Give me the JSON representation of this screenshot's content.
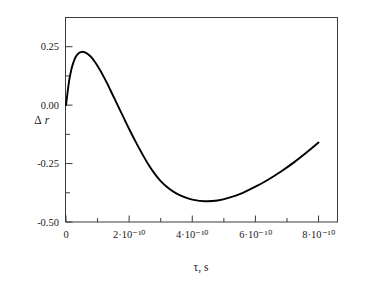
{
  "chart_data": {
    "type": "line",
    "title": "",
    "xlabel": "τ, s",
    "ylabel": "Δr",
    "xlim": [
      0,
      8.6e-10
    ],
    "ylim": [
      -0.5,
      0.375
    ],
    "grid": false,
    "legend": null,
    "x_ticks": [
      {
        "value": 0,
        "label": "0",
        "major": true
      },
      {
        "value": 1e-10,
        "label": "",
        "major": false
      },
      {
        "value": 2e-10,
        "label": "2·10⁻¹⁰",
        "major": true
      },
      {
        "value": 3e-10,
        "label": "",
        "major": false
      },
      {
        "value": 4e-10,
        "label": "4·10⁻¹⁰",
        "major": true
      },
      {
        "value": 5e-10,
        "label": "",
        "major": false
      },
      {
        "value": 6e-10,
        "label": "6·10⁻¹⁰",
        "major": true
      },
      {
        "value": 7e-10,
        "label": "",
        "major": false
      },
      {
        "value": 8e-10,
        "label": "8·10⁻¹⁰",
        "major": true
      }
    ],
    "y_ticks": [
      {
        "value": -0.5,
        "label": "-0.50",
        "major": true
      },
      {
        "value": -0.375,
        "label": "",
        "major": false
      },
      {
        "value": -0.25,
        "label": "-0.25",
        "major": true
      },
      {
        "value": -0.125,
        "label": "",
        "major": false
      },
      {
        "value": 0.0,
        "label": "0.00",
        "major": true
      },
      {
        "value": 0.125,
        "label": "",
        "major": false
      },
      {
        "value": 0.25,
        "label": "0.25",
        "major": true
      },
      {
        "value": 0.375,
        "label": "",
        "major": false
      }
    ],
    "series": [
      {
        "name": "Δr(τ)",
        "color": "#000000",
        "x": [
          0.0,
          5e-12,
          1e-11,
          1.5e-11,
          2e-11,
          3e-11,
          4e-11,
          5e-11,
          6e-11,
          7e-11,
          8e-11,
          9e-11,
          1e-10,
          1.1e-10,
          1.2e-10,
          1.3e-10,
          1.4e-10,
          1.5e-10,
          1.6e-10,
          1.8e-10,
          2e-10,
          2.2e-10,
          2.4e-10,
          2.6e-10,
          2.8e-10,
          3e-10,
          3.2e-10,
          3.4e-10,
          3.6e-10,
          3.8e-10,
          4e-10,
          4.4e-10,
          4.8e-10,
          5.2e-10,
          5.6e-10,
          6e-10,
          6.4e-10,
          6.8e-10,
          7.2e-10,
          7.6e-10,
          8e-10
        ],
        "y": [
          0.0,
          0.055,
          0.105,
          0.14,
          0.168,
          0.205,
          0.222,
          0.228,
          0.226,
          0.218,
          0.205,
          0.188,
          0.168,
          0.145,
          0.12,
          0.094,
          0.066,
          0.038,
          0.01,
          -0.046,
          -0.102,
          -0.155,
          -0.205,
          -0.252,
          -0.292,
          -0.325,
          -0.35,
          -0.37,
          -0.385,
          -0.396,
          -0.404,
          -0.411,
          -0.408,
          -0.395,
          -0.375,
          -0.349,
          -0.319,
          -0.285,
          -0.247,
          -0.205,
          -0.16
        ],
        "y_end_value": -0.1,
        "peak": {
          "x": 5e-11,
          "y": 0.228
        },
        "minimum": {
          "x": 3.05e-10,
          "y": -0.412
        },
        "zero_crossing": {
          "x": 1.62e-10,
          "y": 0.0
        },
        "end": {
          "x": 8e-10,
          "y": -0.1
        }
      }
    ],
    "annotations": []
  },
  "axes": {
    "x_axis_title": "τ, s",
    "y_axis_title_delta": "Δ",
    "y_axis_title_var": "r"
  }
}
